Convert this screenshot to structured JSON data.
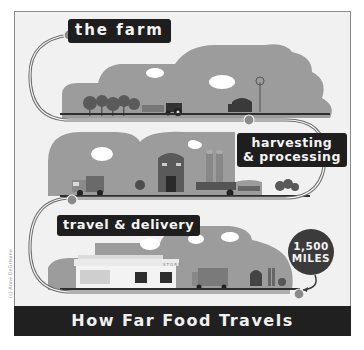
{
  "title": "How Far Food Travels",
  "stages": [
    {
      "id": "farm",
      "label": "the farm"
    },
    {
      "id": "harvesting",
      "label_line1": "harvesting",
      "label_line2": "& processing"
    },
    {
      "id": "travel",
      "label": "travel & delivery"
    }
  ],
  "distance_badge": {
    "value": "1,500",
    "unit": "MILES"
  },
  "store_sign": "STORE",
  "credit": "(c) Anne DeGrisane",
  "colors": {
    "background": "#f1f1f1",
    "cloud": "#9a9a9a",
    "label_bg": "#1e1e1e",
    "label_text": "#f4f4f4",
    "title_bar": "#202020",
    "badge": "#3b3b3b"
  }
}
